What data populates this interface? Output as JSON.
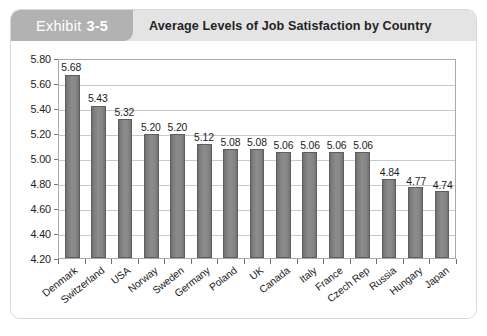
{
  "exhibit": {
    "label_word": "Exhibit",
    "label_number": "3-5",
    "title": "Average Levels of Job Satisfaction by Country"
  },
  "colors": {
    "tab_background": "#b2b2b2",
    "header_background": "#e4e4e4",
    "bar_fill": "#8c8c8c",
    "bar_border": "#5e5e5e",
    "gridline": "#c9c9c9",
    "card_border": "#d8d8d8",
    "title_text": "#232323"
  },
  "chart_data": {
    "type": "bar",
    "title": "Average Levels of Job Satisfaction by Country",
    "xlabel": "",
    "ylabel": "",
    "ylim": [
      4.2,
      5.8
    ],
    "ytick_step": 0.2,
    "ytick_labels": [
      "5.80",
      "5.60",
      "5.40",
      "5.20",
      "5.00",
      "4.80",
      "4.60",
      "4.40",
      "4.20"
    ],
    "grid": true,
    "legend": false,
    "categories": [
      "Denmark",
      "Switzerland",
      "USA",
      "Norway",
      "Sweden",
      "Germany",
      "Poland",
      "UK",
      "Canada",
      "Italy",
      "France",
      "Czech Rep",
      "Russia",
      "Hungary",
      "Japan"
    ],
    "values": [
      5.68,
      5.43,
      5.32,
      5.2,
      5.2,
      5.12,
      5.08,
      5.08,
      5.06,
      5.06,
      5.06,
      5.06,
      4.84,
      4.77,
      4.74
    ],
    "value_labels": [
      "5.68",
      "5.43",
      "5.32",
      "5.20",
      "5.20",
      "5.12",
      "5.08",
      "5.08",
      "5.06",
      "5.06",
      "5.06",
      "5.06",
      "4.84",
      "4.77",
      "4.74"
    ]
  }
}
